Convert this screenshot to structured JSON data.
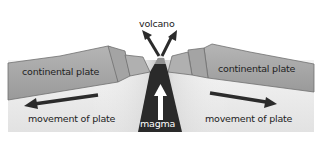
{
  "diagram": {
    "type": "divergent plate boundary cross-section",
    "labels": {
      "volcano": "volcano",
      "left_plate": "continental plate",
      "right_plate": "continental plate",
      "left_movement": "movement of plate",
      "right_movement": "movement of plate",
      "magma": "magma"
    },
    "colors": {
      "plate_fill": "#a9a9a9",
      "plate_edge": "#6e6e6e",
      "mantle_light": "#f0f0f0",
      "mantle_dark": "#bdbdbd",
      "magma": "#2a2a2a",
      "arrow": "#2b2b2b"
    }
  }
}
